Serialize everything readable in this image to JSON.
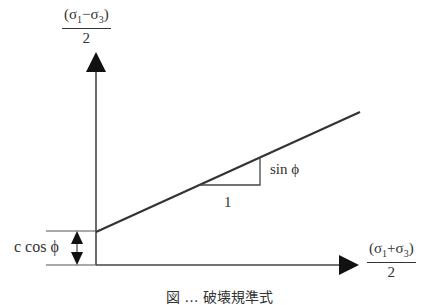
{
  "diagram": {
    "type": "failure-envelope",
    "y_axis": {
      "label_numerator_open": "(σ",
      "label_numerator_sub1": "1",
      "label_numerator_mid": "−σ",
      "label_numerator_sub2": "3",
      "label_numerator_close": ")",
      "label_denominator": "2",
      "label_full": "(σ1−σ3)/2"
    },
    "x_axis": {
      "label_numerator_open": "(σ",
      "label_numerator_sub1": "1",
      "label_numerator_mid": "+σ",
      "label_numerator_sub2": "3",
      "label_numerator_close": ")",
      "label_denominator": "2",
      "label_full": "(σ1+σ3)/2"
    },
    "intercept_label": "c cos ϕ",
    "slope_rise_label": "sin ϕ",
    "slope_run_label": "1",
    "caption": "図 … 破壊規準式",
    "colors": {
      "line": "#333333",
      "background": "#ffffff"
    }
  }
}
